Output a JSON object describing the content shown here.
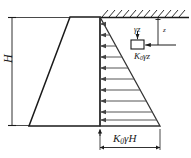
{
  "figure": {
    "type": "engineering-diagram"
  },
  "labels": {
    "wall_height": "H",
    "total_pressure_base": "K₀γH",
    "element_lateral_pressure": "K₀γz",
    "element_vertical_pressure": "γz",
    "depth": "z"
  },
  "label_parts": {
    "K0gH": {
      "pre": "K",
      "sub": "0",
      "post": "γH"
    },
    "K0gz": {
      "pre": "K",
      "sub": "0",
      "post": "γz"
    },
    "gz": {
      "text": "γz"
    },
    "H": {
      "text": "H"
    },
    "z": {
      "text": "z"
    }
  },
  "geometry": {
    "wall": {
      "top_left_x": 70,
      "top_right_x": 100,
      "bottom_left_x": 29,
      "bottom_right_x": 100,
      "top_y": 17,
      "bottom_y": 126
    },
    "pressure_triangle": {
      "apex_x": 100,
      "apex_y": 17,
      "base_right_x": 160,
      "base_y": 126
    },
    "ground_surface_y": 17,
    "ground_surface_x_start": 100,
    "ground_surface_x_end": 189,
    "soil_element": {
      "x": 131,
      "y": 40,
      "w": 13,
      "h": 9
    },
    "arrow_count": 10
  },
  "colors": {
    "line": "#1a1a1a",
    "pressure_line": "#555555",
    "dimension": "#333333",
    "background": "#ffffff"
  }
}
